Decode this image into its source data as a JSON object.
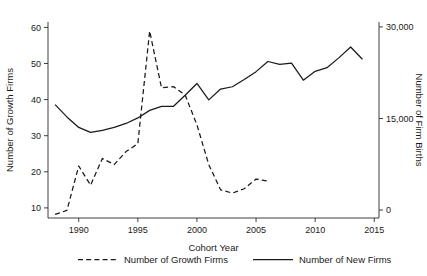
{
  "chart_data": {
    "type": "line",
    "title": "",
    "xlabel": "Cohort Year",
    "ylabel": "Number of Growth Firms",
    "y2label": "Number of Firm Births",
    "xlim": [
      1987.4,
      2015.4
    ],
    "ylim": [
      7.2,
      61.5
    ],
    "y2lim": [
      -1300,
      30800
    ],
    "xticks": [
      1990,
      1995,
      2000,
      2005,
      2010,
      2015
    ],
    "xticklabels": [
      "1990",
      "1995",
      "2000",
      "2005",
      "2010",
      "2015"
    ],
    "yticks": [
      10,
      20,
      30,
      40,
      50,
      60
    ],
    "yticklabels": [
      "10",
      "20",
      "30",
      "40",
      "50",
      "60"
    ],
    "y2ticks": [
      0,
      15000,
      30000
    ],
    "y2ticklabels": [
      "0",
      "15,000",
      "30,000"
    ],
    "grid": false,
    "legend_position": "below",
    "series": [
      {
        "name": "Number of Growth Firms",
        "axis": "left",
        "style": "dashed",
        "color": "#1a1a1a",
        "x": [
          1988,
          1989,
          1990,
          1991,
          1992,
          1993,
          1994,
          1995,
          1996,
          1997,
          1998,
          1999,
          2000,
          2001,
          2002,
          2003,
          2004,
          2005,
          2006
        ],
        "values": [
          8.2,
          9.3,
          21.6,
          16.3,
          23.7,
          22.0,
          25.6,
          27.8,
          59.0,
          43.3,
          43.6,
          41.3,
          33.0,
          22.0,
          15.0,
          14.1,
          15.3,
          18.0,
          17.4
        ]
      },
      {
        "name": "Number of New Firms",
        "axis": "right",
        "style": "solid",
        "color": "#1a1a1a",
        "x": [
          1988,
          1989,
          1990,
          1991,
          1992,
          1993,
          1994,
          1995,
          1996,
          1997,
          1998,
          1999,
          2000,
          2001,
          2002,
          2003,
          2004,
          2005,
          2006,
          2007,
          2008,
          2009,
          2010,
          2011,
          2012,
          2013,
          2014
        ],
        "values_left_scale": [
          38.5,
          34.8,
          31.6,
          30.1,
          30.7,
          31.6,
          32.8,
          34.5,
          36.8,
          38.0,
          38.0,
          41.4,
          45.0,
          40.0,
          43.3,
          44.0,
          46.2,
          48.6,
          51.7,
          50.8,
          51.2,
          46.0,
          48.7,
          49.8,
          52.8,
          56.1,
          52.4
        ],
        "values": [
          17273,
          15254,
          13537,
          12731,
          13052,
          13537,
          14183,
          15093,
          16327,
          16973,
          16973,
          18798,
          20733,
          18050,
          19820,
          20197,
          21377,
          22668,
          24332,
          23847,
          24062,
          21269,
          22722,
          23315,
          24924,
          26700,
          24709
        ]
      }
    ]
  },
  "legend": {
    "items": [
      {
        "label": "Number of Growth Firms",
        "style": "dashed"
      },
      {
        "label": "Number of New Firms",
        "style": "solid"
      }
    ]
  }
}
